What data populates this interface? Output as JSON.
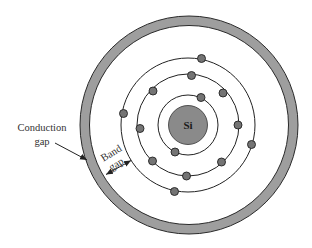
{
  "diagram": {
    "nucleus": {
      "label": "Si",
      "cx": 188,
      "cy": 125,
      "r": 19.5,
      "fill": "#8a8a8a"
    },
    "orbits": [
      {
        "name": "inner-shell",
        "r": 30,
        "electron_count": 2
      },
      {
        "name": "middle-shell",
        "r": 51,
        "electron_count": 8
      },
      {
        "name": "outer-shell",
        "r": 67,
        "electron_count": 4
      }
    ],
    "electrons": [
      {
        "shell": "inner",
        "x": 201,
        "y": 97.5
      },
      {
        "shell": "inner",
        "x": 175,
        "y": 152
      },
      {
        "shell": "middle",
        "x": 191.5,
        "y": 75.5
      },
      {
        "shell": "middle",
        "x": 153,
        "y": 91
      },
      {
        "shell": "middle",
        "x": 223,
        "y": 93
      },
      {
        "shell": "middle",
        "x": 140,
        "y": 128.5
      },
      {
        "shell": "middle",
        "x": 238,
        "y": 125
      },
      {
        "shell": "middle",
        "x": 152.5,
        "y": 161
      },
      {
        "shell": "middle",
        "x": 221.5,
        "y": 162
      },
      {
        "shell": "middle",
        "x": 186.5,
        "y": 176
      },
      {
        "shell": "outer",
        "x": 201.5,
        "y": 58.5
      },
      {
        "shell": "outer",
        "x": 123.5,
        "y": 113.5
      },
      {
        "shell": "outer",
        "x": 251.5,
        "y": 144.5
      },
      {
        "shell": "outer",
        "x": 174.5,
        "y": 191.5
      }
    ],
    "electron_style": {
      "r": 4,
      "fill": "#747474",
      "stroke": "#222222"
    },
    "conduction_ring": {
      "cx": 189,
      "cy": 125,
      "outer_r": 109,
      "inner_r": 99.5,
      "fill": "#9e9e9e",
      "stroke": "#2a2a2a"
    },
    "labels": {
      "conduction_line1": "Conduction",
      "conduction_line2": "gap",
      "band_line1": "Band",
      "band_line2": "gap"
    },
    "colors": {
      "line": "#222222",
      "background": "#ffffff"
    }
  }
}
